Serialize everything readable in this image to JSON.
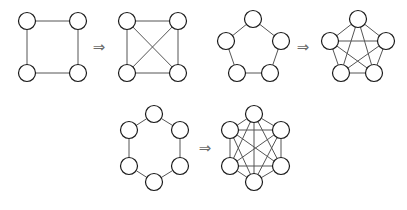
{
  "figure": {
    "background_color": "#ffffff",
    "node_fill_color": "#ffffff",
    "node_stroke_color": "#1a1a1a",
    "edge_color": "#555555",
    "arrow_color": "#6b6b6b",
    "node_radius": 8.5,
    "arrow_glyph": "⇒",
    "panels": [
      {
        "id": "panel-c4-k4",
        "source": {
          "name": "cycle-graph-c4",
          "label": "C4",
          "node_count": 4,
          "edge_count": 4,
          "nodes": [
            {
              "id": "a",
              "x": 27,
              "y": 21
            },
            {
              "id": "b",
              "x": 78,
              "y": 21
            },
            {
              "id": "c",
              "x": 27,
              "y": 73
            },
            {
              "id": "d",
              "x": 78,
              "y": 73
            }
          ],
          "edges": [
            [
              "a",
              "b"
            ],
            [
              "b",
              "d"
            ],
            [
              "d",
              "c"
            ],
            [
              "c",
              "a"
            ]
          ]
        },
        "arrow": {
          "name": "transform-arrow-1",
          "glyph": "⇒",
          "x": 99,
          "y": 47
        },
        "target": {
          "name": "complete-graph-k4",
          "label": "K4",
          "node_count": 4,
          "edge_count": 6,
          "nodes": [
            {
              "id": "a",
              "x": 127,
              "y": 21
            },
            {
              "id": "b",
              "x": 178,
              "y": 21
            },
            {
              "id": "c",
              "x": 127,
              "y": 73
            },
            {
              "id": "d",
              "x": 178,
              "y": 73
            }
          ],
          "edges": [
            [
              "a",
              "b"
            ],
            [
              "b",
              "d"
            ],
            [
              "d",
              "c"
            ],
            [
              "c",
              "a"
            ],
            [
              "a",
              "d"
            ],
            [
              "b",
              "c"
            ]
          ]
        }
      },
      {
        "id": "panel-c5-k5",
        "source": {
          "name": "cycle-graph-c5",
          "label": "C5",
          "node_count": 5,
          "edge_count": 5,
          "nodes": [
            {
              "id": "a",
              "x": 253,
              "y": 19
            },
            {
              "id": "b",
              "x": 226,
              "y": 41
            },
            {
              "id": "c",
              "x": 281,
              "y": 41
            },
            {
              "id": "d",
              "x": 237,
              "y": 73
            },
            {
              "id": "e",
              "x": 270,
              "y": 73
            }
          ],
          "edges": [
            [
              "a",
              "b"
            ],
            [
              "a",
              "c"
            ],
            [
              "b",
              "d"
            ],
            [
              "c",
              "e"
            ],
            [
              "d",
              "e"
            ]
          ]
        },
        "arrow": {
          "name": "transform-arrow-2",
          "glyph": "⇒",
          "x": 303,
          "y": 47
        },
        "target": {
          "name": "complete-graph-k5",
          "label": "K5",
          "node_count": 5,
          "edge_count": 10,
          "nodes": [
            {
              "id": "a",
              "x": 358,
              "y": 19
            },
            {
              "id": "b",
              "x": 330,
              "y": 41
            },
            {
              "id": "c",
              "x": 386,
              "y": 41
            },
            {
              "id": "d",
              "x": 341,
              "y": 73
            },
            {
              "id": "e",
              "x": 374,
              "y": 73
            }
          ],
          "edges": [
            [
              "a",
              "b"
            ],
            [
              "a",
              "c"
            ],
            [
              "b",
              "d"
            ],
            [
              "c",
              "e"
            ],
            [
              "d",
              "e"
            ],
            [
              "a",
              "d"
            ],
            [
              "a",
              "e"
            ],
            [
              "b",
              "c"
            ],
            [
              "b",
              "e"
            ],
            [
              "c",
              "d"
            ]
          ]
        }
      },
      {
        "id": "panel-c6-k6",
        "source": {
          "name": "cycle-graph-c6",
          "label": "C6",
          "node_count": 6,
          "edge_count": 6,
          "nodes": [
            {
              "id": "a",
              "x": 154,
              "y": 114
            },
            {
              "id": "b",
              "x": 129,
              "y": 130
            },
            {
              "id": "c",
              "x": 180,
              "y": 130
            },
            {
              "id": "d",
              "x": 129,
              "y": 166
            },
            {
              "id": "e",
              "x": 180,
              "y": 166
            },
            {
              "id": "f",
              "x": 154,
              "y": 182
            }
          ],
          "edges": [
            [
              "a",
              "b"
            ],
            [
              "a",
              "c"
            ],
            [
              "b",
              "d"
            ],
            [
              "c",
              "e"
            ],
            [
              "d",
              "f"
            ],
            [
              "e",
              "f"
            ]
          ]
        },
        "arrow": {
          "name": "transform-arrow-3",
          "glyph": "⇒",
          "x": 205,
          "y": 148
        },
        "target": {
          "name": "complete-graph-k6",
          "label": "K6",
          "node_count": 6,
          "edge_count": 15,
          "nodes": [
            {
              "id": "a",
              "x": 254,
              "y": 114
            },
            {
              "id": "b",
              "x": 230,
              "y": 130
            },
            {
              "id": "c",
              "x": 281,
              "y": 130
            },
            {
              "id": "d",
              "x": 230,
              "y": 166
            },
            {
              "id": "e",
              "x": 281,
              "y": 166
            },
            {
              "id": "f",
              "x": 254,
              "y": 182
            }
          ],
          "edges": [
            [
              "a",
              "b"
            ],
            [
              "a",
              "c"
            ],
            [
              "b",
              "d"
            ],
            [
              "c",
              "e"
            ],
            [
              "d",
              "f"
            ],
            [
              "e",
              "f"
            ],
            [
              "a",
              "d"
            ],
            [
              "a",
              "e"
            ],
            [
              "a",
              "f"
            ],
            [
              "b",
              "c"
            ],
            [
              "b",
              "e"
            ],
            [
              "b",
              "f"
            ],
            [
              "c",
              "d"
            ],
            [
              "c",
              "f"
            ],
            [
              "d",
              "e"
            ]
          ]
        }
      }
    ]
  }
}
